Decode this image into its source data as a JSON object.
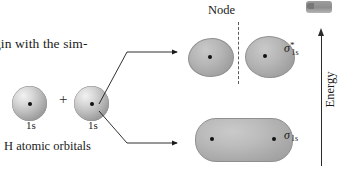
{
  "figure": {
    "type": "molecular-orbital-diagram"
  },
  "body_text": {
    "fragment": "gin with the sim-"
  },
  "reactants": {
    "orbital_a_label": "1s",
    "orbital_b_label": "1s",
    "operator": "+",
    "caption": "H atomic orbitals"
  },
  "node": {
    "label": "Node"
  },
  "products": {
    "antibonding": {
      "sigma": "σ",
      "superscript": "*",
      "subscript": "1s"
    },
    "bonding": {
      "sigma": "σ",
      "subscript": "1s"
    }
  },
  "axis": {
    "label": "Energy",
    "direction": "up"
  },
  "icons": {
    "corner_swatch": "cropped-orbital-swatch",
    "arrow_upper": "arrow-right-icon",
    "arrow_lower": "arrow-right-icon",
    "energy_arrow": "arrow-up-icon"
  },
  "colors": {
    "background": "#ffffff",
    "ink": "#1a1a1a",
    "orbital_gray": "#a9a9a9",
    "node_dash": "#5a5a5a"
  }
}
